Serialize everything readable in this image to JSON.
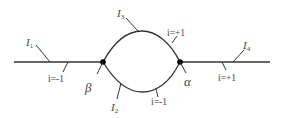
{
  "diagram": {
    "colors": {
      "line": "#333333",
      "text": "#444444",
      "node": "#000000"
    },
    "nodes": [
      {
        "id": "beta",
        "label": "β",
        "x": 103,
        "y": 62
      },
      {
        "id": "alpha",
        "label": "α",
        "x": 180,
        "y": 62
      }
    ],
    "edges": [
      {
        "id": "I1",
        "label": "I",
        "sub": "1",
        "index": "i=-1"
      },
      {
        "id": "I2",
        "label": "I",
        "sub": "2",
        "index": "i=-1"
      },
      {
        "id": "I3",
        "label": "I",
        "sub": "3",
        "index": "i=+1"
      },
      {
        "id": "I4",
        "label": "I",
        "sub": "4",
        "index": "i=+1"
      }
    ]
  }
}
